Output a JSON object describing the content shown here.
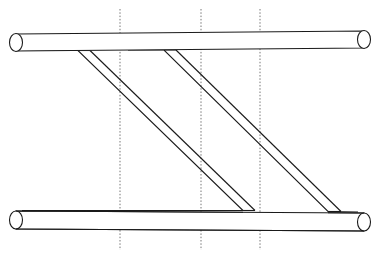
{
  "figure": {
    "canvas": {
      "width": 376,
      "height": 254
    },
    "colors": {
      "background": "#ffffff",
      "stroke": "#1a1a1a",
      "guide": "#777777"
    },
    "stroke_width": 1.1,
    "guide_stroke_width": 1.0,
    "guide_dash": "1.5 1.8"
  },
  "pipes": [
    {
      "name": "top-chord-pipe",
      "label": "Top horizontal pipe",
      "top_line": {
        "x1": 16,
        "y1": 34,
        "x2": 364,
        "y2": 31
      },
      "bottom_line": {
        "x1": 16,
        "y1": 51,
        "x2": 364,
        "y2": 48
      },
      "left_cap": {
        "cx": 16,
        "cy": 42.5,
        "rx": 6.5,
        "ry": 9.0
      },
      "right_cap": {
        "cx": 364,
        "cy": 39.5,
        "rx": 6.5,
        "ry": 9.0
      }
    },
    {
      "name": "bottom-chord-pipe",
      "label": "Bottom horizontal pipe",
      "top_line": {
        "x1": 16,
        "y1": 211,
        "x2": 364,
        "y2": 213
      },
      "bottom_line": {
        "x1": 16,
        "y1": 229,
        "x2": 364,
        "y2": 231
      },
      "left_cap": {
        "cx": 16,
        "cy": 220,
        "rx": 6.5,
        "ry": 9.0
      },
      "right_cap": {
        "cx": 364,
        "cy": 222,
        "rx": 6.5,
        "ry": 9.0
      }
    }
  ],
  "braces": [
    {
      "name": "diagonal-brace-left",
      "label": "Left diagonal brace",
      "outer_path": "M 16,50.5 L 78,50.5 L 243,210.5 L 16,210.5",
      "inner_path": "M 90,50.5 L 255,210.5",
      "inner_top_cap": "M 90,50.5 L 78,50.5",
      "inner_bottom_cap": "M 255,210.5 L 243,210.5"
    },
    {
      "name": "diagonal-brace-right",
      "label": "Right diagonal brace",
      "outer_path": "M 128,50.0 L 164,50.0 L 328,211.5 L 364,212.5",
      "inner_path": "M 176,50.0 L 341,211.5",
      "inner_top_cap": "M 176,50.0 L 164,50.0",
      "inner_bottom_cap": "M 341,211.5 L 328,211.5"
    }
  ],
  "guide_lines": [
    {
      "name": "guide-line-1",
      "x": 120,
      "y1": 9,
      "y2": 250
    },
    {
      "name": "guide-line-2",
      "x": 201,
      "y1": 9,
      "y2": 250
    },
    {
      "name": "guide-line-3",
      "x": 260,
      "y1": 9,
      "y2": 250
    }
  ],
  "chart_data": {
    "type": "diagram",
    "elements": [
      {
        "name": "top-chord-pipe",
        "kind": "pipe",
        "orientation": "horizontal",
        "y_center": 41,
        "x_from": 16,
        "x_to": 364,
        "diameter": 17
      },
      {
        "name": "bottom-chord-pipe",
        "kind": "pipe",
        "orientation": "horizontal",
        "y_center": 220,
        "x_from": 16,
        "x_to": 364,
        "diameter": 18
      },
      {
        "name": "diagonal-brace-left",
        "kind": "brace",
        "from": [
          78,
          50
        ],
        "to": [
          243,
          210
        ],
        "width": 12
      },
      {
        "name": "diagonal-brace-right",
        "kind": "brace",
        "from": [
          164,
          50
        ],
        "to": [
          328,
          211
        ],
        "width": 12
      }
    ],
    "guides": {
      "kind": "vertical-dotted",
      "x_positions": [
        120,
        201,
        260
      ],
      "y_from": 9,
      "y_to": 250
    }
  }
}
